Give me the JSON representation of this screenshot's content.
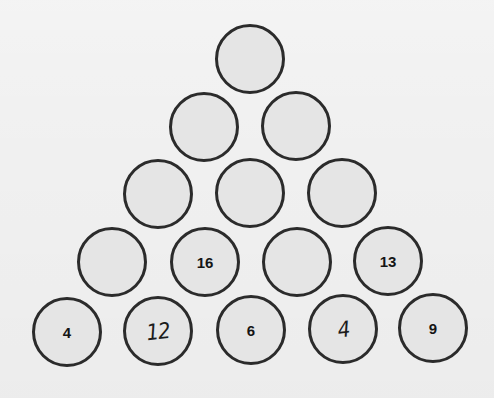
{
  "puzzle": {
    "type": "number-pyramid",
    "colors": {
      "background": "#f0f0f0",
      "cell_fill": "#e5e5e5",
      "cell_border": "#2b2b2b",
      "text": "#151515"
    },
    "rows": [
      {
        "cells": [
          {
            "value": "",
            "handwritten": false
          }
        ]
      },
      {
        "cells": [
          {
            "value": "",
            "handwritten": false
          },
          {
            "value": "",
            "handwritten": false
          }
        ]
      },
      {
        "cells": [
          {
            "value": "",
            "handwritten": false
          },
          {
            "value": "",
            "handwritten": false
          },
          {
            "value": "",
            "handwritten": false
          }
        ]
      },
      {
        "cells": [
          {
            "value": "",
            "handwritten": false
          },
          {
            "value": "16",
            "handwritten": false
          },
          {
            "value": "",
            "handwritten": false
          },
          {
            "value": "13",
            "handwritten": false
          }
        ]
      },
      {
        "cells": [
          {
            "value": "4",
            "handwritten": false
          },
          {
            "value": "12",
            "handwritten": true
          },
          {
            "value": "6",
            "handwritten": false
          },
          {
            "value": "4",
            "handwritten": true
          },
          {
            "value": "9",
            "handwritten": false
          }
        ]
      }
    ]
  }
}
